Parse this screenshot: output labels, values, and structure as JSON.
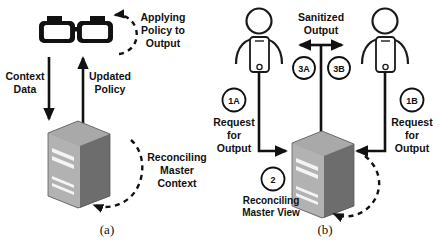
{
  "figure": {
    "panels": [
      {
        "id": "a",
        "caption": "(a)",
        "icon": "glasses-icon",
        "node": "server-icon",
        "labels": {
          "applying_policy": "Applying\nPolicy to\nOutput",
          "applying_policy_lines": [
            "Applying",
            "Policy to",
            "Output"
          ],
          "context_data_lines": [
            "Context",
            "Data"
          ],
          "updated_policy_lines": [
            "Updated",
            "Policy"
          ],
          "reconciling_lines": [
            "Reconciling",
            "Master",
            "Context"
          ]
        },
        "arrows": [
          {
            "name": "context-data-arrow",
            "direction": "down",
            "label": "Context Data"
          },
          {
            "name": "updated-policy-arrow",
            "direction": "up",
            "label": "Updated Policy"
          },
          {
            "name": "applying-policy-loop",
            "style": "dashed",
            "label": "Applying Policy to Output"
          },
          {
            "name": "reconciling-master-context-loop",
            "style": "dashed",
            "label": "Reconciling Master Context"
          }
        ]
      },
      {
        "id": "b",
        "caption": "(b)",
        "node": "server-icon",
        "actors": [
          {
            "name": "user-left",
            "icon": "person-with-phone-icon"
          },
          {
            "name": "user-right",
            "icon": "person-with-phone-icon"
          }
        ],
        "labels": {
          "sanitized_output_lines": [
            "Sanitized",
            "Output"
          ],
          "request_left_lines": [
            "Request",
            "for",
            "Output"
          ],
          "request_right_lines": [
            "Request",
            "for",
            "Output"
          ],
          "reconciling_view_lines": [
            "Reconciling",
            "Master View"
          ]
        },
        "badges": [
          {
            "name": "badge-1a",
            "text": "1A"
          },
          {
            "name": "badge-3a",
            "text": "3A"
          },
          {
            "name": "badge-3b",
            "text": "3B"
          },
          {
            "name": "badge-1b",
            "text": "1B"
          },
          {
            "name": "badge-2",
            "text": "2"
          }
        ],
        "arrows": [
          {
            "name": "request-left-arrow",
            "direction": "down-right",
            "label": "1A Request for Output"
          },
          {
            "name": "request-right-arrow",
            "direction": "down-left",
            "label": "1B Request for Output"
          },
          {
            "name": "sanitized-output-arrow",
            "direction": "bidirectional",
            "label": "Sanitized Output"
          },
          {
            "name": "reconciling-master-view-loop",
            "style": "dashed",
            "label": "Reconciling Master View"
          }
        ]
      }
    ],
    "colors": {
      "ink": "#111111",
      "server_front": "#6e6e6e",
      "server_side": "#a8a8a8",
      "server_top": "#909090",
      "server_slot": "#f2f2f2",
      "background": "#ffffff"
    }
  }
}
